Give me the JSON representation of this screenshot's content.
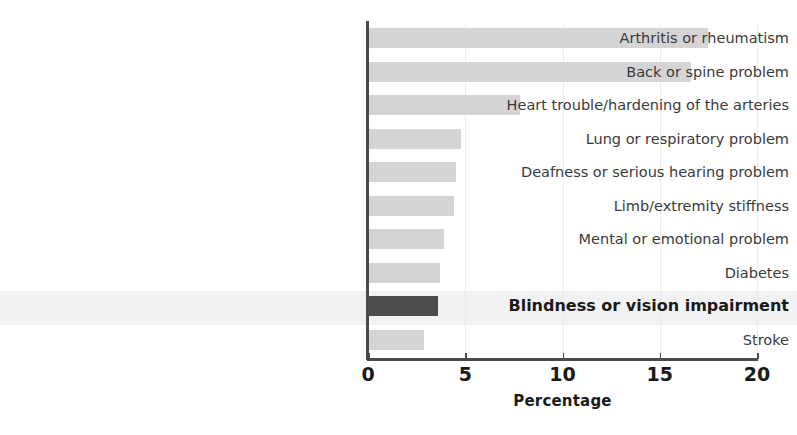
{
  "chart_data": {
    "type": "bar",
    "orientation": "horizontal",
    "title": "",
    "xlabel": "Percentage",
    "ylabel": "",
    "xlim": [
      0,
      20
    ],
    "ylim": null,
    "grid": true,
    "gridline_axis": "x",
    "legend": null,
    "tick_labels": [
      "0",
      "5",
      "10",
      "15",
      "20"
    ],
    "tick_values": [
      0,
      5,
      10,
      15,
      20
    ],
    "categories": [
      "Arthritis or rheumatism",
      "Back or spine problem",
      "Heart trouble/hardening of the arteries",
      "Lung or respiratory problem",
      "Deafness or serious hearing problem",
      "Limb/extremity stiffness",
      "Mental or emotional problem",
      "Diabetes",
      "Blindness or vision impairment",
      "Stroke"
    ],
    "values": [
      17.5,
      16.6,
      7.8,
      4.8,
      4.5,
      4.4,
      3.9,
      3.7,
      3.6,
      2.9
    ],
    "highlighted_category": "Blindness or vision impairment",
    "colors": {
      "bar_default": "#d4d4d4",
      "bar_highlight": "#4d4d4d",
      "highlight_row_band": "#f2f2f2",
      "axis": "#4a4a4a",
      "gridline": "#ececec",
      "label_text": "#3a3a3a",
      "emphasis_text": "#1a1a1a",
      "background": "#ffffff"
    }
  }
}
